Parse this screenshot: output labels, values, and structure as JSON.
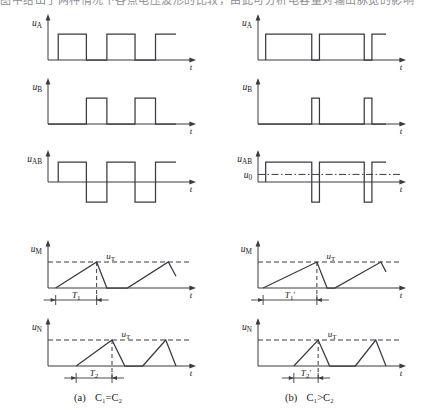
{
  "page": {
    "top_cropped_text": "图中给出了两种情况下各点电压波形的比较，由此可分析电容量对输出脉宽的影响",
    "captions": [
      {
        "id": "a",
        "marker": "(a)",
        "text": "C₁=C₂"
      },
      {
        "id": "b",
        "marker": "(b)",
        "text": "C₁>C₂"
      }
    ]
  },
  "chart_data": {
    "type": "line",
    "title": "",
    "xlabel": "t",
    "ylabel": "",
    "grid": false,
    "legend": "none",
    "axis_arrow": "right",
    "panels": [
      {
        "column": "a",
        "condition": "C₁=C₂",
        "rows": [
          {
            "signal": "u_A",
            "label_main": "u",
            "label_sub": "A",
            "axis_label": "t",
            "type": "square-unipolar",
            "high": 1.0,
            "low": 0.0,
            "edges_x": [
              0.08,
              0.08,
              0.3,
              0.3,
              0.46,
              0.46,
              0.68,
              0.68,
              0.84,
              0.84,
              1.0
            ],
            "levels": [
              0.0,
              1.0,
              1.0,
              0.0,
              0.0,
              1.0,
              1.0,
              0.0,
              0.0,
              1.0,
              1.0
            ]
          },
          {
            "signal": "u_B",
            "label_main": "u",
            "label_sub": "B",
            "axis_label": "t",
            "type": "square-unipolar",
            "high": 1.0,
            "low": 0.0,
            "edges_x": [
              0.0,
              0.3,
              0.3,
              0.46,
              0.46,
              0.68,
              0.68,
              0.84,
              0.84,
              1.0
            ],
            "levels": [
              0.0,
              0.0,
              1.0,
              1.0,
              0.0,
              0.0,
              1.0,
              1.0,
              0.0,
              0.0
            ]
          },
          {
            "signal": "u_AB",
            "label_main": "u",
            "label_sub": "AB",
            "axis_label": "t",
            "type": "square-bipolar",
            "high": 1.0,
            "low": -1.0,
            "reference_line": null,
            "edges_x": [
              0.08,
              0.08,
              0.3,
              0.3,
              0.46,
              0.46,
              0.68,
              0.68,
              0.84,
              0.84,
              1.0
            ],
            "levels": [
              0.0,
              1.0,
              1.0,
              -1.0,
              -1.0,
              1.0,
              1.0,
              -1.0,
              -1.0,
              1.0,
              1.0
            ]
          },
          {
            "signal": "u_M",
            "label_main": "u",
            "label_sub": "M",
            "axis_label": "t",
            "type": "sawtooth",
            "threshold_label_main": "u",
            "threshold_label_sub": "T",
            "threshold_value": 1.0,
            "interval_label_main": "T",
            "interval_label_sub": "1",
            "interval_prime": false,
            "interval_start_x": 0.06,
            "interval_end_x": 0.38,
            "vertices_x": [
              0.06,
              0.38,
              0.46,
              0.62,
              0.94,
              1.0
            ],
            "vertices_y": [
              0.0,
              1.0,
              0.0,
              0.0,
              1.0,
              0.45
            ]
          },
          {
            "signal": "u_N",
            "label_main": "u",
            "label_sub": "N",
            "axis_label": "t",
            "type": "sawtooth",
            "threshold_label_main": "u",
            "threshold_label_sub": "T",
            "threshold_value": 1.0,
            "interval_label_main": "T",
            "interval_label_sub": "2",
            "interval_prime": false,
            "interval_start_x": 0.22,
            "interval_end_x": 0.5,
            "vertices_x": [
              0.22,
              0.5,
              0.6,
              0.74,
              0.92,
              1.0
            ],
            "vertices_y": [
              0.0,
              1.0,
              0.0,
              0.0,
              1.0,
              0.0
            ]
          }
        ]
      },
      {
        "column": "b",
        "condition": "C₁>C₂",
        "rows": [
          {
            "signal": "u_A",
            "label_main": "u",
            "label_sub": "A",
            "axis_label": "t",
            "type": "square-unipolar",
            "high": 1.0,
            "low": 0.0,
            "edges_x": [
              0.06,
              0.06,
              0.42,
              0.42,
              0.48,
              0.48,
              0.83,
              0.83,
              0.89,
              0.89,
              1.0
            ],
            "levels": [
              0.0,
              1.0,
              1.0,
              0.0,
              0.0,
              1.0,
              1.0,
              0.0,
              0.0,
              1.0,
              1.0
            ]
          },
          {
            "signal": "u_B",
            "label_main": "u",
            "label_sub": "B",
            "axis_label": "t",
            "type": "square-unipolar",
            "high": 1.0,
            "low": 0.0,
            "edges_x": [
              0.0,
              0.42,
              0.42,
              0.48,
              0.48,
              0.83,
              0.83,
              0.89,
              0.89,
              1.0
            ],
            "levels": [
              0.0,
              0.0,
              1.0,
              1.0,
              0.0,
              0.0,
              1.0,
              1.0,
              0.0,
              0.0
            ]
          },
          {
            "signal": "u_AB",
            "label_main": "u",
            "label_sub": "AB",
            "axis_label": "t",
            "type": "square-bipolar",
            "high": 1.0,
            "low": -1.0,
            "reference_line": {
              "label_main": "u",
              "label_sub": "0",
              "value": 0.38,
              "style": "dash-dot"
            },
            "edges_x": [
              0.06,
              0.06,
              0.42,
              0.42,
              0.48,
              0.48,
              0.83,
              0.83,
              0.89,
              0.89,
              1.0
            ],
            "levels": [
              0.0,
              1.0,
              1.0,
              -1.0,
              -1.0,
              1.0,
              1.0,
              -1.0,
              -1.0,
              1.0,
              1.0
            ]
          },
          {
            "signal": "u_M",
            "label_main": "u",
            "label_sub": "M",
            "axis_label": "t",
            "type": "sawtooth",
            "threshold_label_main": "u",
            "threshold_label_sub": "T",
            "threshold_value": 1.0,
            "interval_label_main": "T",
            "interval_label_sub": "1",
            "interval_prime": true,
            "interval_start_x": 0.04,
            "interval_end_x": 0.46,
            "vertices_x": [
              0.04,
              0.46,
              0.54,
              0.6,
              0.96,
              1.0
            ],
            "vertices_y": [
              0.0,
              1.0,
              0.0,
              0.0,
              1.0,
              0.62
            ]
          },
          {
            "signal": "u_N",
            "label_main": "u",
            "label_sub": "N",
            "axis_label": "t",
            "type": "sawtooth",
            "threshold_label_main": "u",
            "threshold_label_sub": "T",
            "threshold_value": 1.0,
            "interval_label_main": "T",
            "interval_label_sub": "2",
            "interval_prime": true,
            "interval_start_x": 0.28,
            "interval_end_x": 0.47,
            "vertices_x": [
              0.28,
              0.47,
              0.56,
              0.76,
              0.92,
              1.0
            ],
            "vertices_y": [
              0.0,
              1.0,
              0.0,
              0.0,
              1.0,
              0.0
            ]
          }
        ]
      }
    ]
  }
}
